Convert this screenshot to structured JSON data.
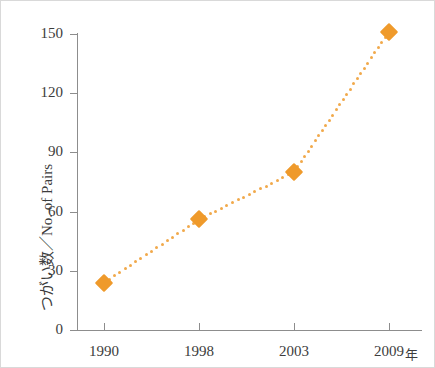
{
  "chart_data": {
    "type": "line",
    "title": "",
    "subtitle": "",
    "xlabel": "年",
    "ylabel": "つがい数／No. of Pairs",
    "categories": [
      "1990",
      "1998",
      "2003",
      "2009"
    ],
    "values": [
      24,
      56,
      80,
      151
    ],
    "series": [
      {
        "name": "No. of Pairs",
        "values": [
          24,
          56,
          80,
          151
        ],
        "color": "#ef9a2b",
        "line_style": "dotted",
        "marker": "diamond"
      }
    ],
    "ylim": [
      0,
      150
    ],
    "yticks": [
      0,
      30,
      60,
      90,
      120,
      150
    ],
    "ytick_labels": [
      "0",
      "30",
      "60",
      "90",
      "120",
      "150"
    ],
    "xtick_labels": [
      "1990",
      "1998",
      "2003",
      "2009"
    ],
    "x_unit_suffix": "年",
    "grid": false,
    "legend": "none",
    "axis_color": "#8d8d8d",
    "text_color": "#3c3c3c",
    "background": "#ffffff"
  },
  "axes": {
    "y": {
      "title": "つがい数／No. of Pairs",
      "ticks": [
        {
          "label": "150",
          "value": 150
        },
        {
          "label": "120",
          "value": 120
        },
        {
          "label": "90",
          "value": 90
        },
        {
          "label": "60",
          "value": 60
        },
        {
          "label": "30",
          "value": 30
        },
        {
          "label": "0",
          "value": 0
        }
      ]
    },
    "x": {
      "unit": "年",
      "ticks": [
        {
          "label": "1990"
        },
        {
          "label": "1998"
        },
        {
          "label": "2003"
        },
        {
          "label": "2009"
        }
      ]
    }
  }
}
